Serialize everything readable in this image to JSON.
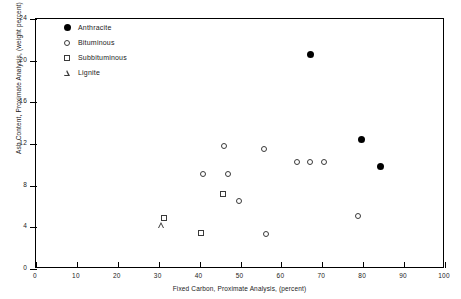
{
  "chart_data": {
    "type": "scatter",
    "title": "",
    "xlabel": "Fixed Carbon, Proximate Analysis, (percent)",
    "ylabel": "Ash Content, Proximate Analysis, (weight percent)",
    "xlim": [
      0,
      100
    ],
    "ylim": [
      0,
      24
    ],
    "xticks": [
      0,
      10,
      20,
      30,
      40,
      50,
      60,
      70,
      80,
      90,
      100
    ],
    "yticks": [
      0,
      4,
      8,
      12,
      16,
      20,
      24
    ],
    "grid": false,
    "legend_position": "top-left inside",
    "series": [
      {
        "name": "Anthracite",
        "marker": "filled-circle",
        "color": "#000000",
        "points": [
          {
            "x": 67.0,
            "y": 20.6
          },
          {
            "x": 79.7,
            "y": 12.4
          },
          {
            "x": 84.3,
            "y": 9.8
          }
        ]
      },
      {
        "name": "Bituminous",
        "marker": "open-circle",
        "color": "#3a3a3a",
        "points": [
          {
            "x": 46.0,
            "y": 11.8
          },
          {
            "x": 55.8,
            "y": 11.5
          },
          {
            "x": 40.8,
            "y": 9.1
          },
          {
            "x": 46.9,
            "y": 9.1
          },
          {
            "x": 63.8,
            "y": 10.3
          },
          {
            "x": 67.0,
            "y": 10.3
          },
          {
            "x": 70.3,
            "y": 10.3
          },
          {
            "x": 49.6,
            "y": 6.5
          },
          {
            "x": 56.2,
            "y": 3.4
          },
          {
            "x": 78.8,
            "y": 5.1
          }
        ]
      },
      {
        "name": "Subbituminous",
        "marker": "open-square",
        "color": "#3a3a3a",
        "points": [
          {
            "x": 31.2,
            "y": 4.9
          },
          {
            "x": 40.3,
            "y": 3.5
          },
          {
            "x": 45.7,
            "y": 7.2
          }
        ]
      },
      {
        "name": "Lignite",
        "marker": "open-triangle",
        "color": "#3a3a3a",
        "points": [
          {
            "x": 30.8,
            "y": 4.2
          }
        ]
      }
    ]
  },
  "legend": {
    "items": [
      {
        "label": "Anthracite",
        "marker": "filled-circle"
      },
      {
        "label": "Bituminous",
        "marker": "open-circle"
      },
      {
        "label": "Subbituminous",
        "marker": "open-square"
      },
      {
        "label": "Lignite",
        "marker": "open-triangle"
      }
    ]
  }
}
